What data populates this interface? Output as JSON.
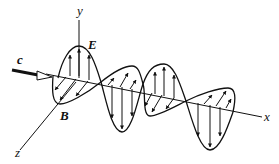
{
  "labels": {
    "y_axis": "y",
    "x_axis": "x",
    "z_axis": "z",
    "electric_field": "E",
    "magnetic_field": "B",
    "propagation_speed": "c"
  },
  "colors": {
    "ink": "#111111",
    "background": "#ffffff"
  }
}
